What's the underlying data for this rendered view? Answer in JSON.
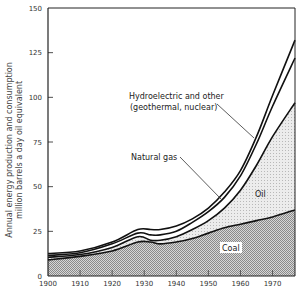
{
  "chart_data": {
    "type": "area",
    "title": "",
    "xlabel": "",
    "ylabel_lines": [
      "Annual energy production and consumption",
      "million barrels a day oil equivalent"
    ],
    "xlim": [
      1900,
      1977
    ],
    "ylim": [
      0,
      150
    ],
    "x_ticks": [
      1900,
      1910,
      1920,
      1930,
      1940,
      1950,
      1960,
      1970
    ],
    "x_tick_labels": [
      "1900",
      "1910",
      "1920",
      "1930",
      "1940",
      "1950",
      "1960",
      "1970"
    ],
    "y_ticks": [
      0,
      25,
      50,
      75,
      100,
      125,
      150
    ],
    "y_tick_labels": [
      "0",
      "25",
      "50",
      "75",
      "100",
      "125",
      "150"
    ],
    "grid": false,
    "stacked": true,
    "x": [
      1900,
      1910,
      1920,
      1928,
      1932,
      1935,
      1940,
      1945,
      1950,
      1955,
      1960,
      1965,
      1970,
      1977
    ],
    "series": [
      {
        "name": "Coal",
        "cumulative": [
          9,
          11,
          14,
          19,
          19,
          18,
          19,
          21,
          24,
          27,
          29,
          31,
          33,
          37
        ],
        "fill": "dark-stipple"
      },
      {
        "name": "Oil",
        "cumulative": [
          10.5,
          12,
          16,
          22,
          20,
          20,
          22,
          26,
          31,
          38,
          48,
          62,
          78,
          97
        ],
        "fill": "light-stipple"
      },
      {
        "name": "Natural gas",
        "cumulative": [
          11.5,
          13,
          18,
          24,
          23,
          23,
          25,
          30,
          36,
          44,
          56,
          74,
          95,
          122
        ],
        "fill": "none"
      },
      {
        "name": "Hydroelectric and other (geothermal, nuclear)",
        "cumulative": [
          12.5,
          14,
          19,
          26,
          26,
          26,
          28,
          32,
          38,
          47,
          59,
          78,
          101,
          132
        ],
        "fill": "none"
      }
    ],
    "annotations": [
      {
        "id": "hydro",
        "lines": [
          "Hydroelectric and other",
          "(geothermal, nuclear)"
        ],
        "points_to": "Hydroelectric and other (geothermal, nuclear)",
        "at_year": 1966
      },
      {
        "id": "gas",
        "lines": [
          "Natural gas"
        ],
        "points_to": "Natural gas",
        "at_year": 1953
      },
      {
        "id": "oil",
        "lines": [
          "Oil"
        ],
        "inside": "Oil"
      },
      {
        "id": "coal",
        "lines": [
          "Coal"
        ],
        "inside": "Coal"
      }
    ],
    "colors": {
      "line": "#111111",
      "axis": "#222222",
      "coal_base": "#bdbdbd",
      "oil_base": "#e6e6e6"
    }
  }
}
